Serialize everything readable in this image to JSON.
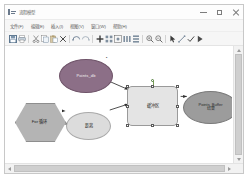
{
  "window": {
    "title": "流程模型",
    "icon": "flowchart-app-icon",
    "controls": {
      "minimize": "最小化",
      "maximize": "最大化",
      "close": "关闭"
    }
  },
  "menubar": {
    "items": [
      {
        "label": "文件(F)",
        "name": "menu-file"
      },
      {
        "label": "编辑(E)",
        "name": "menu-edit"
      },
      {
        "label": "插入(I)",
        "name": "menu-insert"
      },
      {
        "label": "视图(V)",
        "name": "menu-view"
      },
      {
        "label": "窗口(W)",
        "name": "menu-window"
      },
      {
        "label": "帮助(H)",
        "name": "menu-help"
      }
    ]
  },
  "toolbar": {
    "buttons": [
      {
        "name": "save-icon",
        "tip": "保存"
      },
      {
        "name": "print-icon",
        "tip": "打印"
      },
      {
        "name": "cut-icon",
        "tip": "剪切"
      },
      {
        "name": "copy-icon",
        "tip": "复制"
      },
      {
        "name": "paste-icon",
        "tip": "粘贴"
      },
      {
        "name": "delete-icon",
        "tip": "删除"
      },
      {
        "name": "undo-icon",
        "tip": "撤销"
      },
      {
        "name": "redo-icon",
        "tip": "重做"
      },
      {
        "name": "add-node-icon",
        "tip": "添加节点"
      },
      {
        "name": "align-grid-icon",
        "tip": "对齐网格"
      },
      {
        "name": "layout-icon",
        "tip": "自动布局"
      },
      {
        "name": "distribute-h-icon",
        "tip": "水平分布"
      },
      {
        "name": "distribute-v-icon",
        "tip": "垂直分布"
      },
      {
        "name": "zoom-in-icon",
        "tip": "放大"
      },
      {
        "name": "zoom-out-icon",
        "tip": "缩小"
      },
      {
        "name": "pointer-icon",
        "tip": "选择工具"
      },
      {
        "name": "connector-icon",
        "tip": "连接线"
      },
      {
        "name": "validate-icon",
        "tip": "校验"
      },
      {
        "name": "run-icon",
        "tip": "运行"
      }
    ]
  },
  "diagram": {
    "nodes": [
      {
        "id": "for-loop",
        "name": "node-for-loop",
        "label": "For 循环",
        "shape": "hexagon",
        "fill": "#b4b4b4",
        "selected": false
      },
      {
        "id": "points-db",
        "name": "node-points-db",
        "label": "Points_db",
        "shape": "ellipse",
        "fill": "#8c6f87",
        "selected": false
      },
      {
        "id": "distance",
        "name": "node-distance",
        "label": "距离",
        "shape": "ellipse",
        "fill": "#dcdcdc",
        "selected": false
      },
      {
        "id": "buffer",
        "name": "node-buffer",
        "label": "缓冲区",
        "shape": "rounded-rect",
        "fill": "#e4e4e4",
        "selected": true
      },
      {
        "id": "points-buffer",
        "name": "node-points-buffer",
        "label": "Points_Buffer\n结果",
        "shape": "ellipse",
        "fill": "#9c9c9c",
        "selected": false
      }
    ],
    "edges": [
      {
        "name": "edge-for-loop-to-distance",
        "from": "for-loop",
        "to": "distance"
      },
      {
        "name": "edge-points-db-to-buffer",
        "from": "points-db",
        "to": "buffer"
      },
      {
        "name": "edge-distance-to-buffer",
        "from": "distance",
        "to": "buffer"
      },
      {
        "name": "edge-buffer-to-points-buffer",
        "from": "buffer",
        "to": "points-buffer"
      }
    ],
    "tiny_mark": "▪"
  },
  "scrollbars": {
    "vertical": {
      "name": "vertical-scrollbar",
      "position": 0
    },
    "horizontal": {
      "name": "horizontal-scrollbar",
      "position": 0
    }
  }
}
